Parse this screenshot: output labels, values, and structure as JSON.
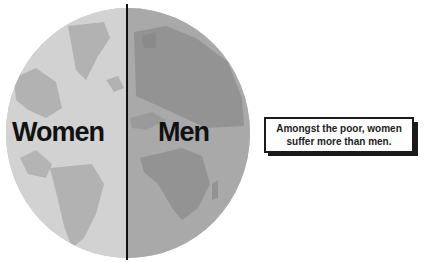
{
  "diagram": {
    "left_label": "Women",
    "right_label": "Men",
    "callout": {
      "line1": "Amongst the poor, women",
      "line2": "suffer more than men."
    },
    "colors": {
      "left_ocean": "#d4d4d4",
      "left_land": "#b0b0b0",
      "right_ocean": "#a8a8a8",
      "right_land": "#8e8e8e",
      "divider": "#111111",
      "text": "#111111"
    }
  }
}
